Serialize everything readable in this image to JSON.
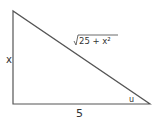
{
  "diagram": {
    "type": "right-triangle",
    "labels": {
      "vertical_side": "x",
      "horizontal_side": "5",
      "hypotenuse_value": "25 + x²",
      "hypotenuse_radical": "√",
      "angle": "u"
    },
    "colors": {
      "stroke": "#555555",
      "text": "#333333",
      "background": "#ffffff"
    }
  }
}
